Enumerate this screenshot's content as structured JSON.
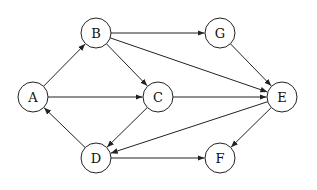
{
  "diagram": {
    "type": "directed-graph",
    "node_radius": 15,
    "colors": {
      "stroke": "#222222",
      "fill": "#ffffff",
      "text": "#111111"
    },
    "nodes": [
      {
        "id": "A",
        "label": "A",
        "x": 33,
        "y": 97
      },
      {
        "id": "B",
        "label": "B",
        "x": 96,
        "y": 33
      },
      {
        "id": "C",
        "label": "C",
        "x": 158,
        "y": 97
      },
      {
        "id": "G",
        "label": "G",
        "x": 220,
        "y": 33
      },
      {
        "id": "E",
        "label": "E",
        "x": 282,
        "y": 97
      },
      {
        "id": "D",
        "label": "D",
        "x": 96,
        "y": 158
      },
      {
        "id": "F",
        "label": "F",
        "x": 220,
        "y": 158
      }
    ],
    "edges": [
      {
        "from": "A",
        "to": "B"
      },
      {
        "from": "A",
        "to": "C"
      },
      {
        "from": "B",
        "to": "G"
      },
      {
        "from": "B",
        "to": "C"
      },
      {
        "from": "B",
        "to": "E"
      },
      {
        "from": "C",
        "to": "E"
      },
      {
        "from": "C",
        "to": "D"
      },
      {
        "from": "G",
        "to": "E"
      },
      {
        "from": "E",
        "to": "D"
      },
      {
        "from": "E",
        "to": "F"
      },
      {
        "from": "D",
        "to": "A"
      },
      {
        "from": "D",
        "to": "F"
      }
    ]
  }
}
